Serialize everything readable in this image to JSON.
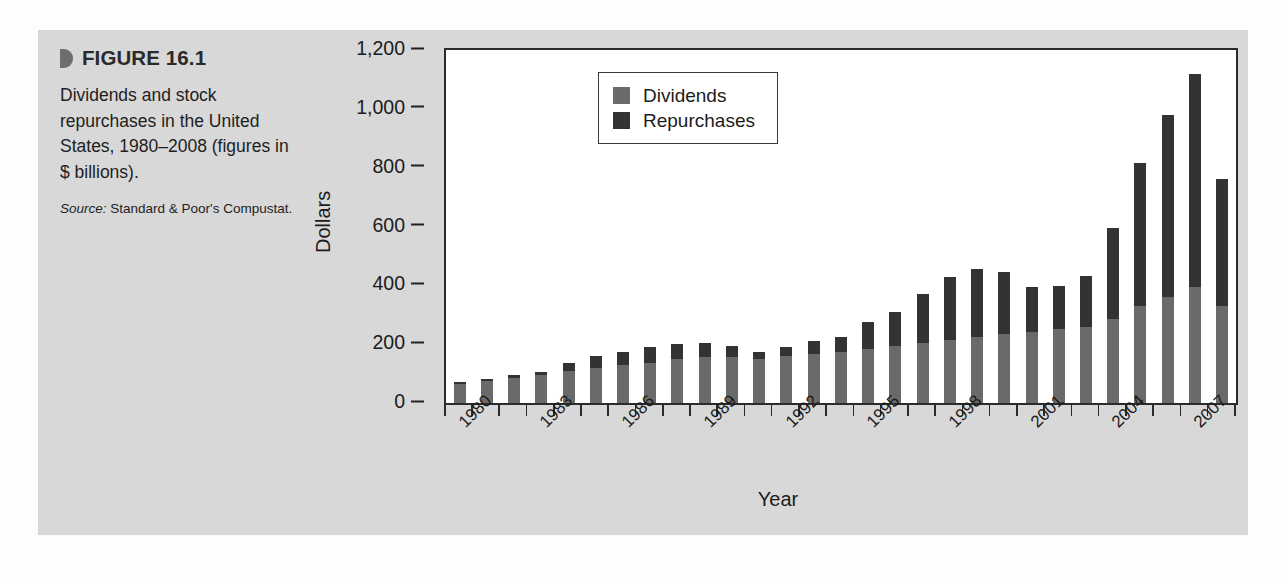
{
  "figure": {
    "marker_icon": "triangle-marker-icon",
    "label": "FIGURE 16.1",
    "description": "Dividends and stock repurchases in the United States, 1980–2008 (figures in $ billions).",
    "source_label": "Source:",
    "source_text": "Standard & Poor's Compustat."
  },
  "colors": {
    "panel_bg": "#d8d8d8",
    "page_bg": "#fdfdfd",
    "plot_bg": "#ffffff",
    "dividends": "#6a6a6a",
    "repurchases": "#333333",
    "axis": "#2b2b2b",
    "text": "#1b1b1b"
  },
  "legend": {
    "position": "top-left-inside",
    "entries": [
      {
        "label": "Dividends",
        "color": "#6a6a6a"
      },
      {
        "label": "Repurchases",
        "color": "#333333"
      }
    ]
  },
  "chart_data": {
    "type": "bar",
    "stacked": true,
    "title": "Dividends and stock repurchases in the United States, 1980–2008 (figures in $ billions)",
    "xlabel": "Year",
    "ylabel": "Dollars",
    "ylim": [
      0,
      1200
    ],
    "yticks": [
      0,
      200,
      400,
      600,
      800,
      1000,
      1200
    ],
    "ytick_labels": [
      "0",
      "200",
      "400",
      "600",
      "800",
      "1,000",
      "1,200"
    ],
    "grid": false,
    "legend_position": "top-left",
    "x_tick_label_rotation": -45,
    "x_tick_label_interval": 3,
    "categories": [
      "1980",
      "1981",
      "1982",
      "1983",
      "1984",
      "1985",
      "1986",
      "1987",
      "1988",
      "1989",
      "1990",
      "1991",
      "1992",
      "1993",
      "1994",
      "1995",
      "1996",
      "1997",
      "1998",
      "1999",
      "2000",
      "2001",
      "2002",
      "2003",
      "2004",
      "2005",
      "2006",
      "2007",
      "2008"
    ],
    "shown_tick_labels": [
      "1980",
      "1983",
      "1986",
      "1989",
      "1992",
      "1995",
      "1998",
      "2001",
      "2004",
      "2007"
    ],
    "series": [
      {
        "name": "Dividends",
        "color": "#6a6a6a",
        "values": [
          65,
          75,
          85,
          95,
          110,
          120,
          128,
          135,
          150,
          158,
          155,
          150,
          160,
          168,
          175,
          185,
          195,
          205,
          215,
          225,
          235,
          240,
          250,
          260,
          285,
          330,
          360,
          395,
          330
        ]
      },
      {
        "name": "Repurchases",
        "color": "#333333",
        "values": [
          5,
          8,
          10,
          12,
          25,
          40,
          45,
          55,
          50,
          45,
          40,
          25,
          30,
          42,
          48,
          90,
          115,
          165,
          215,
          230,
          210,
          155,
          148,
          172,
          310,
          485,
          620,
          725,
          430
        ]
      }
    ],
    "totals": [
      70,
      83,
      95,
      107,
      135,
      160,
      173,
      190,
      200,
      203,
      195,
      175,
      190,
      210,
      223,
      275,
      310,
      370,
      430,
      455,
      445,
      395,
      398,
      432,
      595,
      815,
      980,
      1120,
      760
    ]
  }
}
